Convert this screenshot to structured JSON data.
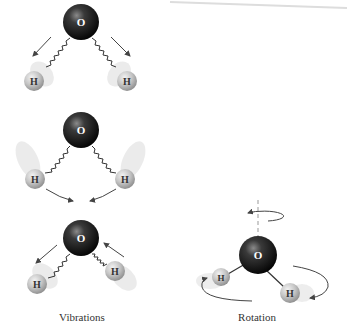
{
  "figure": {
    "captions": {
      "vibrations": "Vibrations",
      "rotation": "Rotation"
    },
    "atoms": {
      "oxygen_label": "O",
      "hydrogen_label": "H"
    },
    "colors": {
      "oxygen": "#1a1a1a",
      "hydrogen": "#bdbdbd",
      "arrow": "#444444",
      "bond": "#333333",
      "axis": "#999999"
    },
    "panels": [
      {
        "name": "vibrations",
        "molecules": [
          {
            "mode": "symmetric-stretch",
            "O": [
              81,
              22
            ],
            "H_left": [
              34,
              81
            ],
            "H_right": [
              127,
              81
            ]
          },
          {
            "mode": "bending",
            "O": [
              81,
              130
            ],
            "H_left": [
              35,
              179
            ],
            "H_right": [
              125,
              179
            ]
          },
          {
            "mode": "asymmetric-stretch",
            "O": [
              81,
              238
            ],
            "H_left": [
              37,
              284
            ],
            "H_right": [
              115,
              271
            ]
          }
        ]
      },
      {
        "name": "rotation",
        "molecules": [
          {
            "mode": "rotation",
            "O": [
              258,
              255
            ],
            "H_left": [
              221,
              277
            ],
            "H_right": [
              290,
              293
            ]
          }
        ]
      }
    ]
  }
}
